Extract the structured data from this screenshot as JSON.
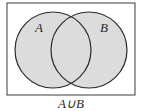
{
  "diagram": {
    "type": "venn",
    "universe": {
      "x": 7,
      "y": 3,
      "width": 128,
      "height": 92,
      "stroke": "#3a3a3a"
    },
    "sets": [
      {
        "label": "A",
        "cx": 53,
        "cy": 50,
        "r": 38,
        "label_x": 35,
        "label_y": 32
      },
      {
        "label": "B",
        "cx": 89,
        "cy": 50,
        "r": 38,
        "label_x": 100,
        "label_y": 32
      }
    ],
    "fill_color": "#dcdcdc",
    "stroke_color": "#2a2a2a",
    "caption": "A∪B",
    "shaded_region": "A∪B"
  }
}
